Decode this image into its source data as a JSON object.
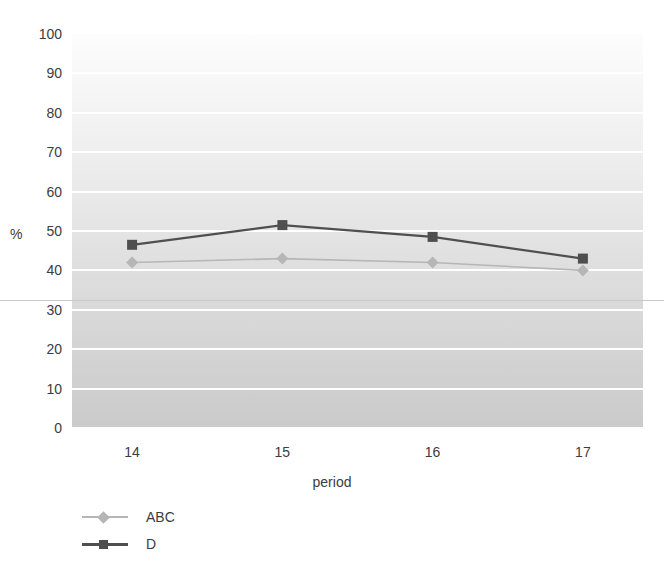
{
  "chart_data": {
    "type": "line",
    "title": "",
    "xlabel": "period",
    "ylabel": "%",
    "categories": [
      "14",
      "15",
      "16",
      "17"
    ],
    "xlim": [
      13.6,
      17.4
    ],
    "ylim": [
      0,
      100
    ],
    "ytick_labels": [
      "100",
      "90",
      "80",
      "70",
      "60",
      "50",
      "40",
      "30",
      "20",
      "10",
      "0"
    ],
    "ytick_values": [
      100,
      90,
      80,
      70,
      60,
      50,
      40,
      30,
      20,
      10,
      0
    ],
    "grid": "horizontal-white-gridlines",
    "legend_position": "below-left",
    "reference_line_value": 32.5,
    "series": [
      {
        "name": "ABC",
        "values": [
          42,
          43,
          42,
          40
        ],
        "color": "#b6b6b6",
        "marker": "diamond"
      },
      {
        "name": "D",
        "values": [
          46.5,
          51.5,
          48.5,
          43
        ],
        "color": "#4f4f4f",
        "marker": "square"
      }
    ]
  },
  "axes": {
    "y_title": "%",
    "x_title": "period"
  },
  "legend": {
    "items": [
      {
        "label": "ABC",
        "color": "#b6b6b6",
        "marker": "diamond-marker-icon"
      },
      {
        "label": "D",
        "color": "#4f4f4f",
        "marker": "square-marker-icon"
      }
    ]
  }
}
